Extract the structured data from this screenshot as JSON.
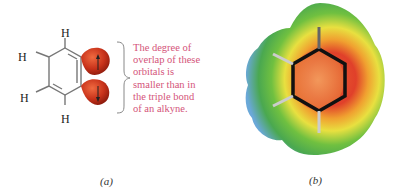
{
  "panel_a": {
    "atoms": [
      "H",
      "H",
      "H",
      "H"
    ],
    "annotation_lines": [
      "The degree of",
      "overlap of these",
      "orbitals is",
      "smaller than in",
      "the triple bond",
      "of an alkyne."
    ],
    "annotation_color": "#d4547a",
    "orbital_color": "#c8321a",
    "caption": "(a)"
  },
  "panel_b": {
    "description": "electrostatic potential map of benzyne",
    "colors": [
      "#d8402a",
      "#f0a030",
      "#e8e040",
      "#58b040",
      "#5a9fd0"
    ],
    "caption": "(b)"
  }
}
